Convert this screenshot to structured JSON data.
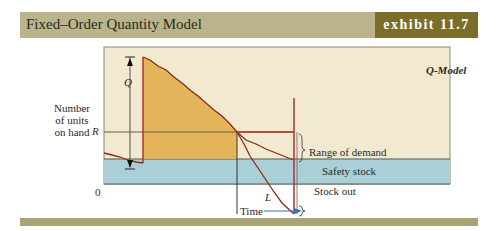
{
  "header": {
    "title": "Fixed–Order Quantity Model",
    "exhibit": "exhibit 11.7"
  },
  "diagram": {
    "model_label": "Q-Model",
    "y_axis_label_lines": [
      "Number",
      "of units",
      "on hand"
    ],
    "labels": {
      "Q": "Q",
      "R": "R",
      "zero": "0",
      "L": "L",
      "time": "Time",
      "range_of_demand": "Range of demand",
      "safety_stock": "Safety stock",
      "stock_out": "Stock out"
    },
    "colors": {
      "background": "#f2ead0",
      "inventory_fill": "#e4b45a",
      "safety_band": "#a9d0d6",
      "curve": "#8a2a1c",
      "red_line": "#b5332a",
      "header": "#b9b48c",
      "exhibit": "#7a6e2a",
      "arrow": "#3d6fb0"
    }
  }
}
